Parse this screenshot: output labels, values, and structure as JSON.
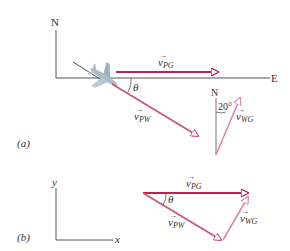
{
  "colors": {
    "vpg": "#b5264a",
    "vpw": "#c8577a",
    "vwg": "#e0a3b8",
    "axis": "#555555",
    "text": "#333333",
    "plane": "#a9bcc8"
  },
  "panel_a": {
    "label": "(a)",
    "axis_north": "N",
    "axis_east": "E",
    "vector_pg": {
      "symbol": "v",
      "subscript": "PG"
    },
    "vector_pw": {
      "symbol": "v",
      "subscript": "PW"
    },
    "vector_wg": {
      "symbol": "v",
      "subscript": "WG"
    },
    "angle_theta": "θ",
    "wind_north": "N",
    "wind_angle": "20°"
  },
  "panel_b": {
    "label": "(b)",
    "axis_y": "y",
    "axis_x": "x",
    "vector_pg": {
      "symbol": "v",
      "subscript": "PG"
    },
    "vector_pw": {
      "symbol": "v",
      "subscript": "PW"
    },
    "vector_wg": {
      "symbol": "v",
      "subscript": "WG"
    },
    "angle_theta": "θ"
  }
}
